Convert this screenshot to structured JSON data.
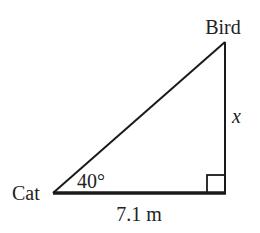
{
  "diagram": {
    "type": "right-triangle",
    "vertices": {
      "cat": {
        "label": "Cat"
      },
      "bird": {
        "label": "Bird"
      },
      "right_angle": {
        "label": ""
      }
    },
    "angle_label": "40°",
    "base_label": "7.1 m",
    "height_label": "x",
    "colors": {
      "stroke": "#1a1a1a",
      "text": "#222222",
      "background": "#ffffff"
    }
  }
}
